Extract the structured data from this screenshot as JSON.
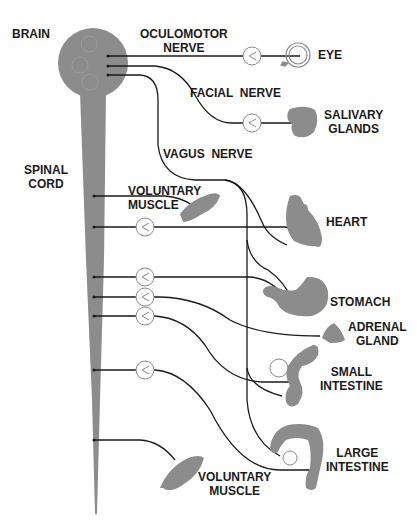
{
  "diagram": {
    "type": "nervous-system-pathways",
    "colors": {
      "tissue": "#8c8c8c",
      "nerve": "#1a1a1a",
      "ganglion": "#8a8a8a",
      "background": "#ffffff"
    },
    "labels": {
      "brain": "BRAIN",
      "spinal_cord": "SPINAL\nCORD",
      "oculomotor_nerve": "OCULOMOTOR\nNERVE",
      "facial_nerve": "FACIAL  NERVE",
      "vagus_nerve": "VAGUS  NERVE",
      "eye": "EYE",
      "salivary_glands": "SALIVARY\nGLANDS",
      "voluntary_muscle_upper": "VOLUNTARY\nMUSCLE",
      "heart": "HEART",
      "stomach": "STOMACH",
      "adrenal_gland": "ADRENAL\nGLAND",
      "small_intestine": "SMALL\nINTESTINE",
      "large_intestine": "LARGE\nINTESTINE",
      "voluntary_muscle_lower": "VOLUNTARY\nMUSCLE"
    }
  }
}
